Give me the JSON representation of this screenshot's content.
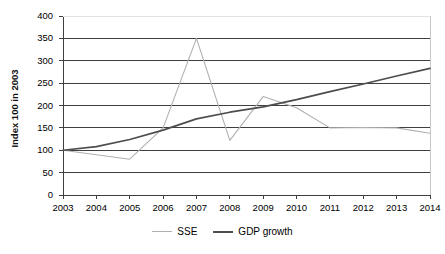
{
  "chart_data": {
    "type": "line",
    "title": "",
    "xlabel": "",
    "ylabel": "Index 100 in 2003",
    "x": [
      2003,
      2004,
      2005,
      2006,
      2007,
      2008,
      2009,
      2010,
      2011,
      2012,
      2013,
      2014
    ],
    "xtick_labels": [
      "2003",
      "2004",
      "2005",
      "2006",
      "2007",
      "2008",
      "2009",
      "2010",
      "2011",
      "2012",
      "2013",
      "2014"
    ],
    "ytick_labels": [
      "0",
      "50",
      "100",
      "150",
      "200",
      "250",
      "300",
      "350",
      "400"
    ],
    "yticks": [
      0,
      50,
      100,
      150,
      200,
      250,
      300,
      350,
      400
    ],
    "ylim": [
      0,
      400
    ],
    "xlim": [
      2003,
      2014
    ],
    "grid": "horizontal",
    "legend_position": "bottom",
    "series": [
      {
        "name": "SSE",
        "color": "#b0b0b0",
        "values": [
          100,
          90,
          80,
          150,
          350,
          122,
          220,
          195,
          150,
          151,
          150,
          138
        ]
      },
      {
        "name": "GDP growth",
        "color": "#4d4d4d",
        "values": [
          100,
          108,
          124,
          145,
          170,
          185,
          197,
          213,
          231,
          248,
          266,
          283
        ]
      }
    ]
  },
  "legend": {
    "items": [
      {
        "label": "SSE",
        "color": "#b0b0b0"
      },
      {
        "label": "GDP growth",
        "color": "#4d4d4d"
      }
    ]
  },
  "axes": {
    "y_title": "Index 100 in 2003"
  }
}
